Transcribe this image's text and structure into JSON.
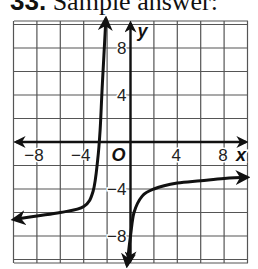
{
  "header": {
    "number": "33.",
    "text": "Sample answer:"
  },
  "chart_data": {
    "type": "line",
    "title": "",
    "xlabel": "x",
    "ylabel": "y",
    "xlim": [
      -10,
      10
    ],
    "ylim": [
      -10,
      10
    ],
    "grid": true,
    "grid_step": 2,
    "x_tick_labels": [
      "−8",
      "−4",
      "4",
      "8"
    ],
    "x_ticks": [
      -8,
      -4,
      4,
      8
    ],
    "y_tick_labels": [
      "8",
      "4",
      "−4",
      "−8"
    ],
    "y_ticks": [
      8,
      4,
      -4,
      -8
    ],
    "origin_label": "O",
    "series": [
      {
        "name": "left branch",
        "points": [
          [
            -10,
            -6.6
          ],
          [
            -8,
            -6.3
          ],
          [
            -6,
            -6.0
          ],
          [
            -4,
            -5.5
          ],
          [
            -3.2,
            -4.2
          ],
          [
            -2.8,
            -1.5
          ],
          [
            -2.6,
            1
          ],
          [
            -2.4,
            5
          ],
          [
            -2.1,
            10.5
          ]
        ],
        "arrows": "both"
      },
      {
        "name": "right branch",
        "points": [
          [
            -0.3,
            -10.5
          ],
          [
            0,
            -8
          ],
          [
            0.3,
            -6
          ],
          [
            1,
            -4.6
          ],
          [
            2,
            -4.0
          ],
          [
            4,
            -3.5
          ],
          [
            6,
            -3.3
          ],
          [
            8,
            -3.1
          ],
          [
            10,
            -3.0
          ]
        ],
        "arrows": "both"
      }
    ],
    "asymptotes_hint": {
      "vertical": [
        -2.3,
        -0.2
      ],
      "horizontal_left": -6.8,
      "horizontal_right": -2.8
    }
  }
}
